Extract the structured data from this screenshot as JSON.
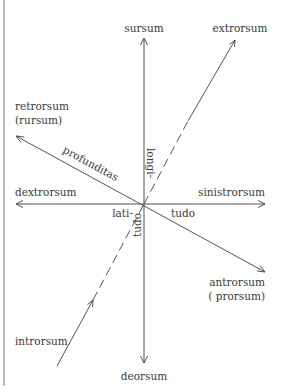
{
  "diagram": {
    "labels": {
      "sursum": "sursum",
      "deorsum": "deorsum",
      "extrorsum": "extrorsum",
      "introrsum": "introrsum",
      "retrorsum": "retrorsum",
      "rursum": "(rursum)",
      "dextrorsum": "dextrorsum",
      "sinistrorsum": "sinistrorsum",
      "antrorsum": "antrorsum",
      "prorsum": "( prorsum)",
      "profunditas": "profunditas",
      "longi": "longi-",
      "tudo_vertical": "tudo",
      "lati": "lati-",
      "tudo_horizontal": "tudo"
    },
    "axes": [
      {
        "name": "vertical",
        "positive": "sursum",
        "negative": "deorsum",
        "dimension": "longitudo",
        "style": "solid"
      },
      {
        "name": "horizontal",
        "positive": "sinistrorsum",
        "negative": "dextrorsum",
        "dimension": "latitudo",
        "style": "solid"
      },
      {
        "name": "depth",
        "positive": "antrorsum",
        "negative": "retrorsum",
        "dimension": "profunditas",
        "style": "solid"
      },
      {
        "name": "inward-outward",
        "positive": "extrorsum",
        "negative": "introrsum",
        "style": "dashed-near-center"
      }
    ]
  }
}
